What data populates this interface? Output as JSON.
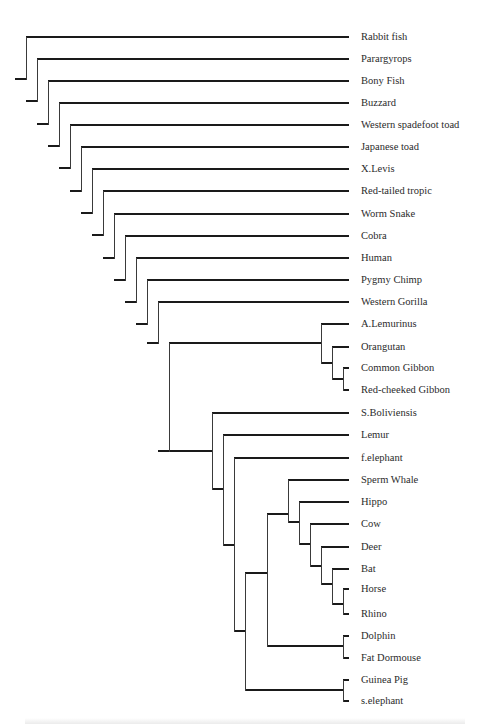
{
  "figure": {
    "type": "phylogenetic-tree-cladogram",
    "line_color": "#1a1a1a",
    "background": "#ffffff",
    "caption_visible": "cut off / illegible"
  },
  "leaves": [
    {
      "label": "Rabbit fish",
      "y": 37
    },
    {
      "label": "Parargyrops",
      "y": 59
    },
    {
      "label": "Bony Fish",
      "y": 81
    },
    {
      "label": "Buzzard",
      "y": 103
    },
    {
      "label": "Western spadefoot toad",
      "y": 125
    },
    {
      "label": "Japanese toad",
      "y": 147
    },
    {
      "label": "X.Levis",
      "y": 169
    },
    {
      "label": "Red-tailed tropic",
      "y": 191
    },
    {
      "label": "Worm Snake",
      "y": 214
    },
    {
      "label": "Cobra",
      "y": 236
    },
    {
      "label": "Human",
      "y": 258
    },
    {
      "label": "Pygmy Chimp",
      "y": 280
    },
    {
      "label": "Western Gorilla",
      "y": 302
    },
    {
      "label": "A.Lemurinus",
      "y": 324
    },
    {
      "label": "Orangutan",
      "y": 347
    },
    {
      "label": "Common Gibbon",
      "y": 368
    },
    {
      "label": "Red-cheeked Gibbon",
      "y": 390
    },
    {
      "label": "S.Boliviensis",
      "y": 413
    },
    {
      "label": "Lemur",
      "y": 435
    },
    {
      "label": "f.elephant",
      "y": 458
    },
    {
      "label": "Sperm Whale",
      "y": 480
    },
    {
      "label": "Hippo",
      "y": 502
    },
    {
      "label": "Cow",
      "y": 524
    },
    {
      "label": "Deer",
      "y": 547
    },
    {
      "label": "Bat",
      "y": 569
    },
    {
      "label": "Horse",
      "y": 589
    },
    {
      "label": "Rhino",
      "y": 614
    },
    {
      "label": "Dolphin",
      "y": 636
    },
    {
      "label": "Fat Dormouse",
      "y": 658
    },
    {
      "label": "Guinea Pig",
      "y": 680
    },
    {
      "label": "s.elephant",
      "y": 701
    }
  ],
  "newick": "(Rabbit fish,(Parargyrops,(Bony Fish,(Buzzard,(Western spadefoot toad,(Japanese toad,(X.Levis,(Red-tailed tropic,(Worm Snake,(Cobra,(Human,(Pygmy Chimp,(Western Gorilla,((A.Lemurinus,(Orangutan,(Common Gibbon,Red-cheeked Gibbon))),(S.Boliviensis,(Lemur,(f.elephant,(((Sperm Whale,(Hippo,(Cow,(Deer,(Bat,(Horse,Rhino)))))),(Dolphin,Fat Dormouse)),(Guinea Pig,s.elephant)))))))))))))))))));",
  "segments": {
    "h": [
      [
        26,
        37,
        349
      ],
      [
        37,
        59,
        349
      ],
      [
        48,
        81,
        349
      ],
      [
        59,
        103,
        349
      ],
      [
        70,
        125,
        349
      ],
      [
        81,
        147,
        349
      ],
      [
        92,
        169,
        349
      ],
      [
        103,
        191,
        349
      ],
      [
        114,
        214,
        349
      ],
      [
        125,
        236,
        349
      ],
      [
        136,
        258,
        349
      ],
      [
        147,
        280,
        349
      ],
      [
        158,
        302,
        349
      ],
      [
        321,
        324,
        349
      ],
      [
        332,
        347,
        349
      ],
      [
        343,
        368,
        349
      ],
      [
        343,
        390,
        349
      ],
      [
        212,
        413,
        349
      ],
      [
        223,
        435,
        349
      ],
      [
        234,
        458,
        349
      ],
      [
        288,
        480,
        349
      ],
      [
        299,
        502,
        349
      ],
      [
        310,
        524,
        349
      ],
      [
        321,
        547,
        349
      ],
      [
        332,
        569,
        349
      ],
      [
        343,
        589,
        349
      ],
      [
        343,
        614,
        349
      ],
      [
        343,
        636,
        349
      ],
      [
        343,
        658,
        349
      ],
      [
        343,
        680,
        349
      ],
      [
        343,
        701,
        349
      ],
      [
        15,
        79,
        26
      ],
      [
        26,
        101,
        37
      ],
      [
        37,
        124,
        48
      ],
      [
        48,
        146,
        59
      ],
      [
        59,
        168,
        70
      ],
      [
        70,
        191,
        81
      ],
      [
        81,
        213,
        92
      ],
      [
        92,
        235,
        103
      ],
      [
        103,
        258,
        114
      ],
      [
        114,
        280,
        125
      ],
      [
        125,
        302,
        136
      ],
      [
        136,
        324,
        147
      ],
      [
        147,
        343,
        158
      ],
      [
        158,
        451,
        169
      ],
      [
        169,
        343,
        321
      ],
      [
        321,
        363,
        332
      ],
      [
        332,
        379,
        343
      ],
      [
        169,
        451,
        212
      ],
      [
        212,
        489,
        223
      ],
      [
        223,
        545,
        234
      ],
      [
        234,
        631,
        245
      ],
      [
        245,
        573,
        267
      ],
      [
        267,
        514,
        288
      ],
      [
        288,
        522,
        299
      ],
      [
        299,
        544,
        310
      ],
      [
        310,
        566,
        321
      ],
      [
        321,
        584,
        332
      ],
      [
        332,
        604,
        343
      ],
      [
        267,
        646,
        343
      ],
      [
        245,
        690,
        343
      ]
    ],
    "v": [
      [
        26,
        37,
        79
      ],
      [
        37,
        59,
        101
      ],
      [
        48,
        81,
        124
      ],
      [
        59,
        103,
        146
      ],
      [
        70,
        125,
        168
      ],
      [
        81,
        147,
        191
      ],
      [
        92,
        169,
        213
      ],
      [
        103,
        191,
        235
      ],
      [
        114,
        214,
        258
      ],
      [
        125,
        236,
        280
      ],
      [
        136,
        258,
        302
      ],
      [
        147,
        280,
        324
      ],
      [
        158,
        302,
        343
      ],
      [
        169,
        343,
        451
      ],
      [
        321,
        324,
        363
      ],
      [
        332,
        347,
        379
      ],
      [
        343,
        368,
        390
      ],
      [
        212,
        413,
        489
      ],
      [
        223,
        435,
        545
      ],
      [
        234,
        458,
        631
      ],
      [
        245,
        573,
        690
      ],
      [
        267,
        514,
        646
      ],
      [
        288,
        480,
        522
      ],
      [
        299,
        502,
        544
      ],
      [
        310,
        524,
        566
      ],
      [
        321,
        547,
        584
      ],
      [
        332,
        569,
        604
      ],
      [
        343,
        589,
        614
      ],
      [
        343,
        636,
        658
      ],
      [
        343,
        680,
        701
      ]
    ]
  }
}
